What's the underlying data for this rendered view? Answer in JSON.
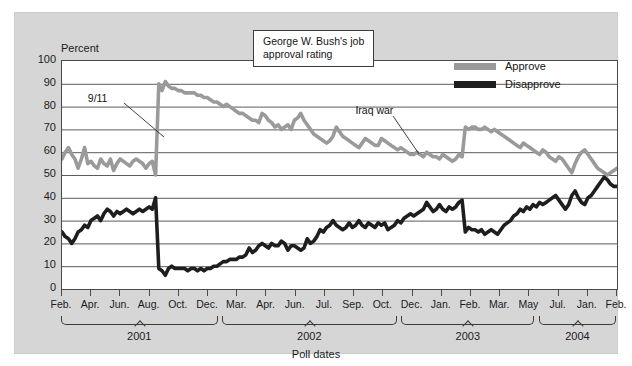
{
  "figure": {
    "title_box": [
      "George W. Bush's job",
      "approval rating"
    ],
    "y_axis_title": "Percent",
    "x_axis_title": "Poll dates"
  },
  "legend": {
    "position": "top-right",
    "items": [
      {
        "label": "Approve",
        "color": "#9a9a9a"
      },
      {
        "label": "Disapprove",
        "color": "#1e1e1e"
      }
    ]
  },
  "annotations": [
    {
      "label": "9/11",
      "x_pct": 16.0,
      "y_pct": 83.0
    },
    {
      "label": "Iraq war",
      "x_pct": 63.5,
      "y_pct": 77.5
    }
  ],
  "years": [
    {
      "label": "2001",
      "start_pct": 0.0,
      "end_pct": 28.2
    },
    {
      "label": "2002",
      "start_pct": 29.0,
      "end_pct": 60.5
    },
    {
      "label": "2003",
      "start_pct": 61.3,
      "end_pct": 85.3
    },
    {
      "label": "2004",
      "start_pct": 86.1,
      "end_pct": 100.0
    }
  ],
  "chart_data": {
    "type": "line",
    "title": "George W. Bush's job approval rating",
    "xlabel": "Poll dates",
    "ylabel": "Percent",
    "ylim": [
      0,
      100
    ],
    "ytick_step": 10,
    "yticks": [
      0,
      10,
      20,
      30,
      40,
      50,
      60,
      70,
      80,
      90,
      100
    ],
    "grid": "horizontal",
    "x_tick_labels": [
      "Feb.",
      "Apr.",
      "Jun.",
      "Aug.",
      "Oct.",
      "Dec.",
      "Mar.",
      "Apr.",
      "Jun.",
      "Jul.",
      "Sep.",
      "Oct.",
      "Dec.",
      "Jan.",
      "Feb.",
      "Mar.",
      "May",
      "Jul.",
      "Jan.",
      "Feb."
    ],
    "x_tick_positions_pct": [
      2.6,
      10.0,
      17.4,
      24.8,
      32.2,
      39.6,
      47.0,
      52.5,
      58.0,
      63.5,
      69.0,
      74.5,
      80.0,
      85.5,
      88.5,
      91.5,
      94.5,
      97.5,
      99.0,
      100.0
    ],
    "series": [
      {
        "name": "Approve",
        "color": "#9a9a9a",
        "values": [
          57,
          60,
          62,
          59,
          57,
          53,
          57,
          62,
          55,
          56,
          54,
          53,
          57,
          55,
          54,
          57,
          52,
          55,
          57,
          56,
          55,
          54,
          56,
          57,
          56,
          55,
          53,
          55,
          56,
          50,
          90,
          87,
          91,
          89,
          88,
          88,
          87,
          87,
          86,
          86,
          86,
          86,
          85,
          85,
          84,
          84,
          83,
          82,
          82,
          81,
          80,
          81,
          80,
          79,
          78,
          77,
          77,
          76,
          75,
          74,
          74,
          73,
          77,
          76,
          74,
          73,
          71,
          72,
          70,
          71,
          72,
          70,
          74,
          75,
          77,
          74,
          72,
          70,
          68,
          67,
          66,
          65,
          64,
          65,
          67,
          71,
          69,
          67,
          66,
          65,
          64,
          63,
          62,
          64,
          66,
          65,
          64,
          63,
          63,
          66,
          65,
          64,
          63,
          62,
          61,
          62,
          61,
          60,
          59,
          59,
          60,
          59,
          58,
          60,
          59,
          58,
          58,
          57,
          59,
          58,
          57,
          56,
          57,
          59,
          58,
          71,
          70,
          71,
          71,
          70,
          70,
          71,
          70,
          69,
          70,
          69,
          68,
          67,
          66,
          65,
          64,
          63,
          62,
          64,
          63,
          62,
          61,
          60,
          59,
          61,
          60,
          58,
          57,
          56,
          58,
          57,
          55,
          53,
          51,
          55,
          58,
          60,
          61,
          59,
          57,
          55,
          53,
          52,
          51,
          50,
          51,
          52,
          53
        ]
      },
      {
        "name": "Disapprove",
        "color": "#1e1e1e",
        "values": [
          25,
          23,
          22,
          20,
          22,
          25,
          26,
          28,
          27,
          30,
          31,
          32,
          30,
          33,
          35,
          34,
          32,
          34,
          33,
          34,
          35,
          34,
          33,
          34,
          35,
          34,
          35,
          36,
          35,
          40,
          9,
          8,
          6,
          9,
          10,
          9,
          9,
          9,
          9,
          8,
          9,
          9,
          8,
          9,
          8,
          9,
          9,
          10,
          10,
          11,
          12,
          12,
          13,
          13,
          13,
          14,
          14,
          15,
          18,
          16,
          17,
          19,
          20,
          19,
          18,
          20,
          19,
          19,
          21,
          20,
          17,
          19,
          19,
          18,
          17,
          18,
          22,
          20,
          21,
          23,
          26,
          25,
          27,
          28,
          30,
          28,
          27,
          26,
          27,
          29,
          27,
          28,
          30,
          28,
          27,
          29,
          28,
          27,
          29,
          28,
          29,
          26,
          27,
          28,
          30,
          29,
          31,
          32,
          33,
          32,
          33,
          34,
          35,
          38,
          36,
          34,
          35,
          37,
          35,
          34,
          36,
          35,
          36,
          38,
          39,
          25,
          27,
          26,
          26,
          25,
          26,
          24,
          25,
          26,
          25,
          24,
          26,
          28,
          29,
          30,
          32,
          33,
          35,
          34,
          36,
          35,
          37,
          36,
          38,
          37,
          38,
          39,
          40,
          41,
          39,
          37,
          35,
          37,
          41,
          43,
          40,
          38,
          37,
          40,
          41,
          43,
          45,
          47,
          49,
          48,
          46,
          45,
          45
        ]
      }
    ]
  }
}
